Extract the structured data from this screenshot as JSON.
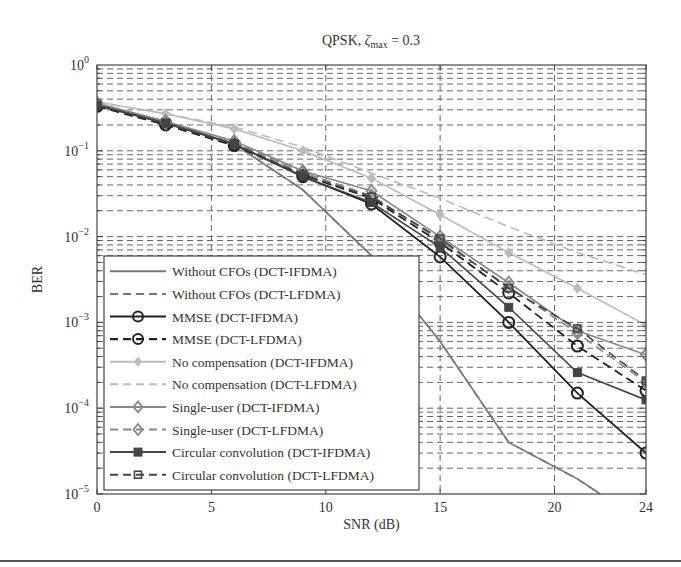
{
  "chart_data": {
    "type": "line",
    "title": "QPSK, ζmax = 0.3",
    "title_parts": {
      "prefix": "QPSK, ",
      "symbol": "ζ",
      "subscript": "max",
      "suffix": " = 0.3"
    },
    "xlabel": "SNR (dB)",
    "ylabel": "BER",
    "xlim": [
      0,
      24
    ],
    "ylim": [
      1e-05,
      1
    ],
    "yscale": "log",
    "xticks": [
      0,
      5,
      10,
      15,
      20,
      24
    ],
    "yticks": [
      {
        "exp": 0,
        "label": "10",
        "sup": "0"
      },
      {
        "exp": -1,
        "label": "10",
        "sup": "−1"
      },
      {
        "exp": -2,
        "label": "10",
        "sup": "−2"
      },
      {
        "exp": -3,
        "label": "10",
        "sup": "−3"
      },
      {
        "exp": -4,
        "label": "10",
        "sup": "−4"
      },
      {
        "exp": -5,
        "label": "10",
        "sup": "−5"
      }
    ],
    "grid": true,
    "legend_position": "lower left",
    "x": [
      0,
      3,
      6,
      9,
      12,
      15,
      18,
      21,
      24
    ],
    "series": [
      {
        "name": "Without CFOs (DCT-IFDMA)",
        "color": "#777777",
        "dash": "solid",
        "marker": "none",
        "width": 1.6,
        "x": [
          0,
          3,
          6,
          9,
          12,
          15,
          18,
          21,
          22
        ],
        "values": [
          0.35,
          0.22,
          0.12,
          0.035,
          0.006,
          0.0006,
          4e-05,
          1.5e-05,
          1e-05
        ]
      },
      {
        "name": "Without CFOs (DCT-LFDMA)",
        "color": "#777777",
        "dash": "dashed",
        "marker": "none",
        "width": 1.6,
        "x": [
          0,
          3,
          6,
          9,
          12,
          15,
          18,
          21,
          22
        ],
        "values": [
          0.35,
          0.22,
          0.12,
          0.035,
          0.006,
          0.0006,
          4e-05,
          1.5e-05,
          1e-05
        ]
      },
      {
        "name": "MMSE (DCT-IFDMA)",
        "color": "#222222",
        "dash": "solid",
        "marker": "circle",
        "width": 1.8,
        "values": [
          0.34,
          0.21,
          0.12,
          0.05,
          0.024,
          0.0058,
          0.001,
          0.00015,
          3e-05
        ]
      },
      {
        "name": "MMSE (DCT-LFDMA)",
        "color": "#222222",
        "dash": "dashed",
        "marker": "circle",
        "width": 1.8,
        "values": [
          0.33,
          0.2,
          0.115,
          0.052,
          0.028,
          0.0085,
          0.0022,
          0.00053,
          0.00016
        ]
      },
      {
        "name": "No compensation (DCT-IFDMA)",
        "color": "#bbbbbb",
        "dash": "solid",
        "marker": "diamond-filled",
        "width": 1.6,
        "values": [
          0.37,
          0.27,
          0.18,
          0.1,
          0.048,
          0.018,
          0.0065,
          0.0025,
          0.00093
        ]
      },
      {
        "name": "No compensation (DCT-LFDMA)",
        "color": "#bbbbbb",
        "dash": "dashed",
        "marker": "none",
        "width": 1.6,
        "values": [
          0.37,
          0.27,
          0.19,
          0.11,
          0.055,
          0.028,
          0.013,
          0.0065,
          0.0036
        ]
      },
      {
        "name": "Single-user (DCT-IFDMA)",
        "color": "#888888",
        "dash": "solid",
        "marker": "diamond",
        "width": 1.6,
        "values": [
          0.36,
          0.22,
          0.13,
          0.058,
          0.034,
          0.01,
          0.0029,
          0.0008,
          0.00042
        ]
      },
      {
        "name": "Single-user (DCT-LFDMA)",
        "color": "#888888",
        "dash": "dashed",
        "marker": "diamond",
        "width": 1.6,
        "values": [
          0.35,
          0.21,
          0.125,
          0.056,
          0.03,
          0.009,
          0.0026,
          0.00075,
          0.0002
        ]
      },
      {
        "name": "Circular convolution (DCT-IFDMA)",
        "color": "#444444",
        "dash": "solid",
        "marker": "square-filled",
        "width": 1.6,
        "values": [
          0.34,
          0.21,
          0.12,
          0.05,
          0.025,
          0.0075,
          0.0015,
          0.00026,
          0.000125
        ]
      },
      {
        "name": "Circular convolution (DCT-LFDMA)",
        "color": "#444444",
        "dash": "dashed",
        "marker": "square",
        "width": 1.6,
        "values": [
          0.34,
          0.21,
          0.12,
          0.053,
          0.029,
          0.0095,
          0.0025,
          0.00085,
          0.00021
        ]
      }
    ]
  },
  "layout": {
    "plot": {
      "left": 97,
      "top": 65,
      "right": 646,
      "bottom": 494
    },
    "legend": {
      "left": 104,
      "top": 256,
      "right": 419,
      "bottom": 490
    }
  }
}
